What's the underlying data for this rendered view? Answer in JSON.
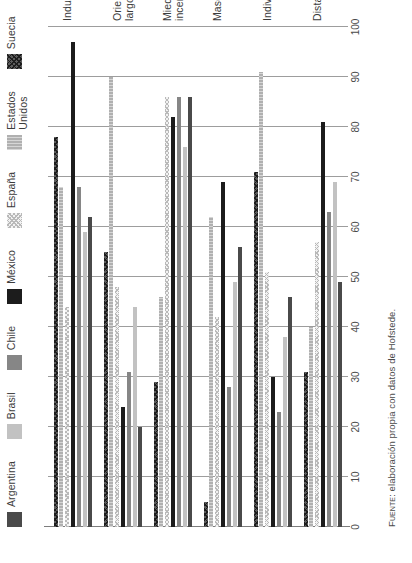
{
  "chart_data": {
    "type": "bar",
    "orientation": "horizontal",
    "title": "",
    "subtitle": "",
    "xlabel": "",
    "ylabel": "",
    "xlim": [
      0,
      100
    ],
    "xticks": [
      0,
      10,
      20,
      30,
      40,
      50,
      60,
      70,
      80,
      90,
      100
    ],
    "grid": true,
    "grid_axis": "x",
    "legend_position": "top",
    "categories": [
      "Distancia del poder",
      "Individualismo",
      "Masculinidad",
      "Miedo a la\nincertidumbre",
      "Orientación de\nlargo plazo",
      "Indulgencia"
    ],
    "series": [
      {
        "name": "Argentina",
        "color": "#4a4a4a",
        "pattern": "solid",
        "values": [
          49,
          46,
          56,
          86,
          20,
          62
        ]
      },
      {
        "name": "Brasil",
        "color": "#c2c2c2",
        "pattern": "solid",
        "values": [
          69,
          38,
          49,
          76,
          44,
          59
        ]
      },
      {
        "name": "Chile",
        "color": "#868686",
        "pattern": "solid",
        "values": [
          63,
          23,
          28,
          86,
          31,
          68
        ]
      },
      {
        "name": "México",
        "color": "#1c1c1c",
        "pattern": "solid",
        "values": [
          81,
          30,
          69,
          82,
          24,
          97
        ]
      },
      {
        "name": "España",
        "color": "#f2f2f2",
        "pattern": "fine-dots",
        "values": [
          57,
          51,
          42,
          86,
          48,
          44
        ]
      },
      {
        "name": "Estados\nUnidos",
        "color": "#bdbdbd",
        "pattern": "vertical-stripes",
        "values": [
          40,
          91,
          62,
          46,
          90,
          68
        ]
      },
      {
        "name": "Suecia",
        "color": "#5c5c5c",
        "pattern": "cross-hatch",
        "values": [
          31,
          71,
          5,
          29,
          55,
          78
        ]
      }
    ]
  },
  "legend": {
    "items": [
      {
        "label": "Argentina"
      },
      {
        "label": "Brasil"
      },
      {
        "label": "Chile"
      },
      {
        "label": "México"
      },
      {
        "label": "España"
      },
      {
        "label": "Estados\nUnidos"
      },
      {
        "label": "Suecia"
      }
    ]
  },
  "axis": {
    "ticks": [
      "0",
      "10",
      "20",
      "30",
      "40",
      "50",
      "60",
      "70",
      "80",
      "90",
      "100"
    ]
  },
  "footer": {
    "source_prefix": "Fuente:",
    "source_text": " elaboración propia con datos de Hofstede."
  }
}
